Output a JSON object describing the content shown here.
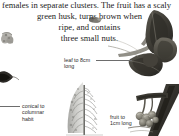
{
  "page": {
    "background_color": "#ffffff",
    "text_color": "#1b1b1b",
    "label_color": "#2a2a2a",
    "leader_line_color": "#6d6d6d",
    "width": 179,
    "height": 136
  },
  "body_text": {
    "line_1": "females in separate clusters. The fruit has a scaly",
    "line_2": "green husk, turns brown when",
    "line_3": "ripe, and contains",
    "line_4": "three small nuts."
  },
  "annotations": {
    "leaf": {
      "text": "leaf to 8cm\nlong",
      "leader": "horizontal-leader-line"
    },
    "habit": {
      "text": "conical to\ncolumnar\nhabit",
      "leader": "horizontal-leader-line"
    },
    "fruit": {
      "text": "fruit to\n1cm long",
      "leader": "none"
    }
  },
  "figures": {
    "leaf_branch": {
      "name": "leaf-branch-photograph",
      "description": "dark photograph of a leafy branch with compound leaves"
    },
    "tree_habit": {
      "name": "tree-habit-illustration",
      "description": "grey line illustration of a conical columnar tree"
    },
    "fruit_branch": {
      "name": "fruit-cluster-photograph",
      "description": "photograph of small round fruits on a dark branch"
    },
    "left_catkin": {
      "name": "catkin-photograph-partial",
      "description": "partial photograph at left margin"
    },
    "left_cone": {
      "name": "cone-photograph-partial",
      "description": "partial dark photograph at left margin"
    },
    "top_small": {
      "name": "small-fruit-photograph-partial",
      "description": "small dark photograph detail"
    }
  }
}
